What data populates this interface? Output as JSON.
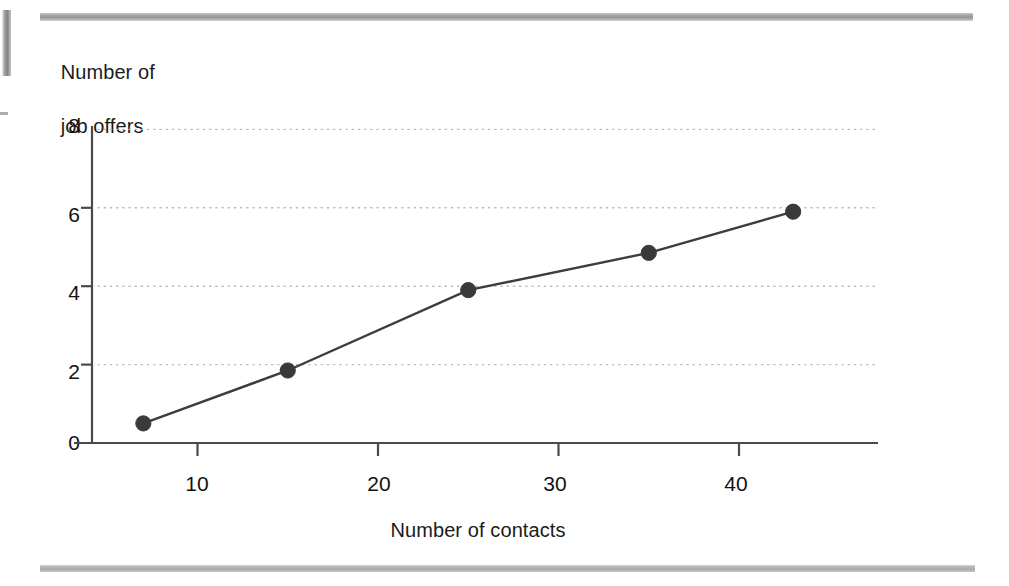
{
  "figure": {
    "background_color": "#ffffff",
    "line_color": "#3d3d3d",
    "marker_color": "#3a3a3a",
    "grid_color": "#b9b9b9",
    "axis_color": "#4a4a4a",
    "rule_color": "#9e9e9e"
  },
  "chart_data": {
    "type": "line",
    "title": "",
    "subtitle": "",
    "xlabel": "Number of contacts",
    "ylabel": "Number of\njob offers",
    "ylabel_line1": "Number of",
    "ylabel_line2": "job offers",
    "x": [
      7,
      15,
      25,
      35,
      43
    ],
    "values": [
      0.5,
      1.85,
      3.9,
      4.85,
      5.9
    ],
    "series": [
      {
        "name": "job offers",
        "points": [
          {
            "x": 7,
            "y": 0.5
          },
          {
            "x": 15,
            "y": 1.85
          },
          {
            "x": 25,
            "y": 3.9
          },
          {
            "x": 35,
            "y": 4.85
          },
          {
            "x": 43,
            "y": 5.9
          }
        ]
      }
    ],
    "xlim": [
      2,
      48
    ],
    "ylim": [
      0,
      8
    ],
    "xticks": [
      10,
      20,
      30,
      40
    ],
    "xtick_labels": [
      "10",
      "20",
      "30",
      "40"
    ],
    "yticks": [
      0,
      2,
      4,
      6,
      8
    ],
    "ytick_labels": [
      "0",
      "2",
      "4",
      "6",
      "8"
    ],
    "gridlines_y": [
      2,
      4,
      6,
      8
    ],
    "grid": "horizontal-dotted",
    "legend": "none",
    "markers": "filled-circle",
    "annotations": []
  },
  "ticks": {
    "y": [
      {
        "label": "8",
        "top": 114,
        "value": 8
      },
      {
        "label": "6",
        "top": 203,
        "value": 6
      },
      {
        "label": "4",
        "top": 281,
        "value": 4
      },
      {
        "label": "2",
        "top": 360,
        "value": 2
      },
      {
        "label": "0",
        "top": 431,
        "value": 0
      }
    ],
    "x": [
      {
        "label": "10",
        "left": 173,
        "value": 10
      },
      {
        "label": "20",
        "left": 355,
        "value": 20
      },
      {
        "label": "30",
        "left": 531,
        "value": 30
      },
      {
        "label": "40",
        "left": 712,
        "value": 40
      }
    ]
  }
}
